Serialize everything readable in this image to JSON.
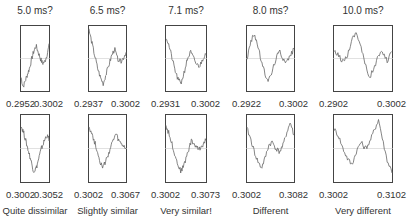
{
  "chart_data": {
    "type": "line",
    "layout": {
      "rows": 2,
      "cols": 5
    },
    "columns": [
      {
        "title": "5.0 ms?",
        "top_xticks": [
          "0.2952",
          "0.3002"
        ],
        "bottom_xticks": [
          "0.3002",
          "0.3052"
        ],
        "verdict": "Quite dissimilar"
      },
      {
        "title": "6.5 ms?",
        "top_xticks": [
          "0.2937",
          "0.3002"
        ],
        "bottom_xticks": [
          "0.3002",
          "0.3067"
        ],
        "verdict": "Slightly similar"
      },
      {
        "title": "7.1 ms?",
        "top_xticks": [
          "0.2931",
          "0.3002"
        ],
        "bottom_xticks": [
          "0.3002",
          "0.3073"
        ],
        "verdict": "Very similar!"
      },
      {
        "title": "8.0 ms?",
        "top_xticks": [
          "0.2922",
          "0.3002"
        ],
        "bottom_xticks": [
          "0.3002",
          "0.3082"
        ],
        "verdict": "Different"
      },
      {
        "title": "10.0 ms?",
        "top_xticks": [
          "0.2902",
          "0.3002"
        ],
        "bottom_xticks": [
          "0.3002",
          "0.3102"
        ],
        "verdict": "Very different"
      }
    ],
    "series": [
      {
        "name": "5.0 ms top",
        "values": [
          0.2,
          0.05,
          0.15,
          0.25,
          0.35,
          0.5,
          0.62,
          0.7,
          0.6,
          0.5,
          0.42,
          0.45,
          0.55,
          0.7
        ]
      },
      {
        "name": "6.5 ms top",
        "values": [
          0.95,
          0.75,
          0.55,
          0.35,
          0.2,
          0.1,
          0.25,
          0.4,
          0.55,
          0.65,
          0.5,
          0.45,
          0.5,
          0.6
        ]
      },
      {
        "name": "7.1 ms top",
        "values": [
          0.85,
          0.7,
          0.5,
          0.3,
          0.15,
          0.12,
          0.3,
          0.5,
          0.6,
          0.5,
          0.4,
          0.38,
          0.5,
          0.6
        ]
      },
      {
        "name": "8.0 ms top",
        "values": [
          0.5,
          0.75,
          0.9,
          0.7,
          0.45,
          0.25,
          0.15,
          0.3,
          0.5,
          0.62,
          0.5,
          0.45,
          0.55,
          0.65
        ]
      },
      {
        "name": "10.0 ms top",
        "values": [
          0.6,
          0.55,
          0.45,
          0.55,
          0.8,
          0.92,
          0.7,
          0.4,
          0.2,
          0.35,
          0.55,
          0.6,
          0.45,
          0.65
        ]
      },
      {
        "name": "5.0 ms bottom",
        "values": [
          0.85,
          0.75,
          0.6,
          0.45,
          0.3,
          0.15,
          0.2,
          0.35,
          0.5,
          0.6,
          0.7,
          0.65
        ]
      },
      {
        "name": "6.5 ms bottom",
        "values": [
          0.85,
          0.7,
          0.55,
          0.35,
          0.2,
          0.3,
          0.45,
          0.6,
          0.72,
          0.6,
          0.55,
          0.5
        ]
      },
      {
        "name": "7.1 ms bottom",
        "values": [
          0.85,
          0.7,
          0.5,
          0.3,
          0.15,
          0.25,
          0.45,
          0.62,
          0.55,
          0.48,
          0.55,
          0.65
        ]
      },
      {
        "name": "8.0 ms bottom",
        "values": [
          0.8,
          0.65,
          0.45,
          0.3,
          0.2,
          0.35,
          0.55,
          0.6,
          0.5,
          0.45,
          0.55,
          0.75,
          0.9,
          0.7
        ]
      },
      {
        "name": "10.0 ms bottom",
        "values": [
          0.8,
          0.7,
          0.5,
          0.35,
          0.25,
          0.45,
          0.6,
          0.5,
          0.6,
          0.78,
          0.95,
          0.6,
          0.3,
          0.15
        ]
      }
    ],
    "xlabel": "",
    "ylabel": "",
    "grid": false
  }
}
